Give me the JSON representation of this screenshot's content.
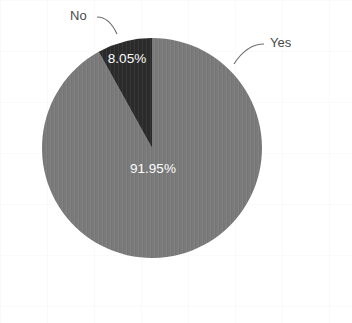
{
  "chart_data": {
    "type": "pie",
    "title": "",
    "categories": [
      "Yes",
      "No"
    ],
    "values": [
      91.95,
      8.05
    ],
    "value_labels": [
      "91.95%",
      "8.05%"
    ],
    "units": "percent",
    "legend": "none",
    "label_placement": "outside-with-leader-lines",
    "series": [
      {
        "name": "Response",
        "slices": [
          {
            "label": "Yes",
            "value": 91.95,
            "value_label": "91.95%",
            "color": "#7a7a7a",
            "start_angle_deg": 0,
            "end_angle_deg": 331.02
          },
          {
            "label": "No",
            "value": 8.05,
            "value_label": "8.05%",
            "color": "#2b2b2b",
            "start_angle_deg": 331.02,
            "end_angle_deg": 360
          }
        ]
      }
    ]
  },
  "figure": {
    "background_color": "#ffffff",
    "center_x": 152,
    "center_y": 148,
    "radius": 110
  },
  "labels": {
    "no": "No",
    "yes": "Yes",
    "slice_no_value": "8.05%",
    "slice_yes_value": "91.95%"
  },
  "colors": {
    "slice_yes": "#7a7a7a",
    "slice_no": "#2b2b2b",
    "slice_label_text": "#ffffff",
    "category_label_text": "#4a4a4a",
    "leader_line": "#6d6d6d"
  },
  "source_note": {
    "text": "",
    "legible": false
  }
}
